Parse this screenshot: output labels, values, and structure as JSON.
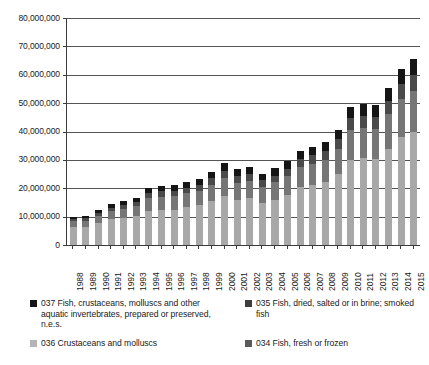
{
  "chart_data": {
    "type": "bar",
    "title": "",
    "subtitle": "",
    "xlabel": "",
    "ylabel": "",
    "stacked": true,
    "grid": true,
    "legend_position": "bottom",
    "ylim": [
      0,
      80000000
    ],
    "ytick_step": 10000000,
    "ytick_labels": [
      "0",
      "10,000,000",
      "20,000,000",
      "30,000,000",
      "40,000,000",
      "50,000,000",
      "60,000,000",
      "70,000,000",
      "80,000,000"
    ],
    "ytick_values": [
      0,
      10000000,
      20000000,
      30000000,
      40000000,
      50000000,
      60000000,
      70000000,
      80000000
    ],
    "categories": [
      "1988",
      "1989",
      "1990",
      "1991",
      "1992",
      "1993",
      "1994",
      "1995",
      "1996",
      "1997",
      "1998",
      "1999",
      "2000",
      "2001",
      "2002",
      "2003",
      "2004",
      "2005",
      "2006",
      "2007",
      "2008",
      "2009",
      "2010",
      "2011",
      "2012",
      "2013",
      "2014",
      "2015"
    ],
    "series": [
      {
        "name": "034 Fish, fresh or frozen",
        "code": "034",
        "color": "#a8a8a8",
        "values": [
          6300000,
          6500000,
          7800000,
          9100000,
          9600000,
          10300000,
          12000000,
          12300000,
          12500000,
          13300000,
          14000000,
          15600000,
          17300000,
          16000000,
          16500000,
          14800000,
          16000000,
          17500000,
          20400000,
          21200000,
          22200000,
          25000000,
          30000000,
          30500000,
          30300000,
          34000000,
          38000000,
          40000000
        ]
      },
      {
        "name": "036 Crustaceans and molluscs",
        "code": "036",
        "color": "#767676",
        "values": [
          2000000,
          2100000,
          2600000,
          2900000,
          3200000,
          3500000,
          4500000,
          4800000,
          4800000,
          5000000,
          5200000,
          5700000,
          6400000,
          5900000,
          6000000,
          5700000,
          6100000,
          6800000,
          7100000,
          7500000,
          7900000,
          8800000,
          10500000,
          10700000,
          10600000,
          12000000,
          13500000,
          14300000
        ]
      },
      {
        "name": "035 Fish, dried, salted or in brine; smoked fish",
        "code": "035",
        "color": "#4a4a4a",
        "values": [
          800000,
          850000,
          1000000,
          1150000,
          1250000,
          1350000,
          1700000,
          1800000,
          1850000,
          1950000,
          2050000,
          2250000,
          2500000,
          2350000,
          2400000,
          2250000,
          2400000,
          2650000,
          2800000,
          2950000,
          3100000,
          3400000,
          4100000,
          4200000,
          4200000,
          4700000,
          5300000,
          5600000
        ]
      },
      {
        "name": "037 Fish, crustaceans, molluscs and other aquatic invertebrates, prepared or preserved, n.e.s.",
        "code": "037",
        "color": "#151515",
        "values": [
          900000,
          950000,
          1100000,
          1250000,
          1350000,
          1450000,
          1800000,
          1900000,
          1950000,
          2050000,
          2150000,
          2350000,
          2600000,
          2450000,
          2500000,
          2350000,
          2500000,
          2750000,
          2900000,
          3050000,
          3200000,
          3500000,
          4200000,
          4300000,
          4300000,
          4800000,
          5400000,
          5700000
        ]
      }
    ],
    "totals": [
      10000000,
      10400000,
      12500000,
      14400000,
      15400000,
      16600000,
      20000000,
      20800000,
      21100000,
      22300000,
      23400000,
      25900000,
      28800000,
      26700000,
      27400000,
      25100000,
      27000000,
      29700000,
      33200000,
      34700000,
      36400000,
      40700000,
      48800000,
      49700000,
      49400000,
      55500000,
      62200000,
      65600000
    ]
  },
  "legend": {
    "items": [
      {
        "label": "037 Fish, crustaceans, molluscs and other aquatic invertebrates, prepared or preserved, n.e.s.",
        "color": "#151515"
      },
      {
        "label": "035 Fish, dried, salted or in brine; smoked fish",
        "color": "#3d3d3d"
      },
      {
        "label": "036 Crustaceans and molluscs",
        "color": "#b5b5b5"
      },
      {
        "label": "034 Fish, fresh or frozen",
        "color": "#5a5a5a"
      }
    ]
  },
  "axis": {
    "y_max_label": "80,000,000",
    "y_min_label": "0"
  }
}
